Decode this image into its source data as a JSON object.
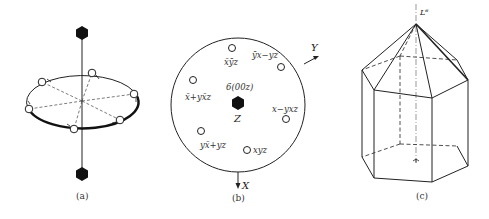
{
  "figure": {
    "panels": [
      {
        "id": "a",
        "caption": "(a)",
        "description": "Six-fold rotation axis with six equivalent points on a horizontal circle"
      },
      {
        "id": "b",
        "caption": "(b)",
        "center_label": "6(00z)",
        "center_axis_label": "Z",
        "axis_x_label": "X",
        "axis_y_label": "Y",
        "points": [
          {
            "label": "x̄ȳz",
            "display": "x̄ȳz"
          },
          {
            "label": "ȳx−yz",
            "display": "ȳx−yz"
          },
          {
            "label": "x̄+yx̄z",
            "display": "x̄+yx̄z"
          },
          {
            "label": "x−yxz",
            "display": "x−yxz"
          },
          {
            "label": "yx̄+yz",
            "display": "yx̄+yz"
          },
          {
            "label": "xyz",
            "display": "xyz"
          }
        ]
      },
      {
        "id": "c",
        "caption": "(c)",
        "axis_label": "L⁶",
        "description": "Hexagonal prism with hexagonal pyramid cap"
      }
    ],
    "colors": {
      "line": "#222222",
      "fill_symbol": "#111111",
      "background": "#ffffff"
    }
  }
}
